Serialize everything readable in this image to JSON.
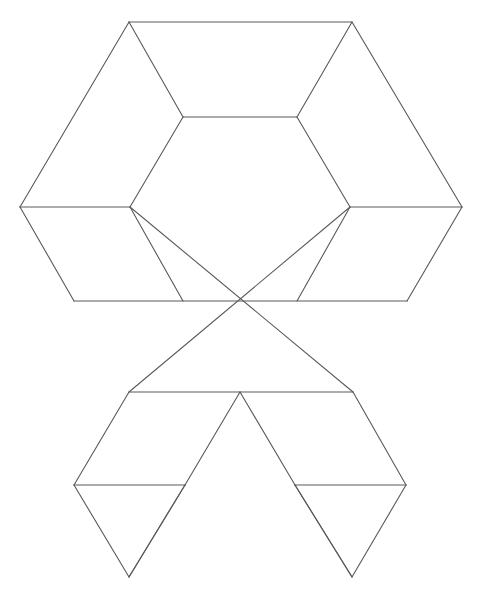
{
  "figure": {
    "width": 477,
    "height": 593,
    "background_color": "#ffffff",
    "line_color": "#5a5a5a",
    "line_width": 1.1
  },
  "chart_data": {
    "type": "diagram",
    "xlabel": "",
    "ylabel": "",
    "grid": false,
    "legend": null,
    "xlim": [
      0,
      477
    ],
    "ylim": [
      0,
      593
    ],
    "vertices": {
      "top_left": [
        129,
        22
      ],
      "top_right": [
        352,
        22
      ],
      "inner_top_left": [
        183,
        117
      ],
      "inner_top_right": [
        297,
        117
      ],
      "outer_left": [
        20,
        207
      ],
      "inner_left": [
        130,
        207
      ],
      "inner_right": [
        350,
        207
      ],
      "outer_right": [
        462,
        207
      ],
      "mid_left": [
        74,
        301
      ],
      "mid_right": [
        407,
        301
      ],
      "lower_left": [
        129,
        392
      ],
      "center_cross": [
        240,
        392
      ],
      "lower_right": [
        353,
        392
      ],
      "bottom_bar_left_start": [
        74,
        485
      ],
      "bottom_bar_left_end": [
        185,
        485
      ],
      "bottom_bar_right_start": [
        295,
        485
      ],
      "bottom_bar_right_end": [
        406,
        485
      ],
      "bottom_apex_left": [
        129,
        577
      ],
      "bottom_apex_right": [
        352,
        577
      ]
    },
    "edges": [
      {
        "name": "outer-hex-top",
        "from": [
          129,
          22
        ],
        "to": [
          352,
          22
        ]
      },
      {
        "name": "outer-hex-upper-right",
        "from": [
          352,
          22
        ],
        "to": [
          462,
          207
        ]
      },
      {
        "name": "outer-hex-lower-right",
        "from": [
          462,
          207
        ],
        "to": [
          407,
          301
        ]
      },
      {
        "name": "outer-hex-upper-left",
        "from": [
          129,
          22
        ],
        "to": [
          20,
          207
        ]
      },
      {
        "name": "outer-hex-lower-left",
        "from": [
          20,
          207
        ],
        "to": [
          74,
          301
        ]
      },
      {
        "name": "inner-hex-top",
        "from": [
          183,
          117
        ],
        "to": [
          297,
          117
        ]
      },
      {
        "name": "inner-hex-upper-left",
        "from": [
          183,
          117
        ],
        "to": [
          130,
          207
        ]
      },
      {
        "name": "inner-hex-lower-left",
        "from": [
          130,
          207
        ],
        "to": [
          183,
          301
        ]
      },
      {
        "name": "inner-hex-upper-right",
        "from": [
          297,
          117
        ],
        "to": [
          350,
          207
        ]
      },
      {
        "name": "inner-hex-lower-right",
        "from": [
          350,
          207
        ],
        "to": [
          297,
          301
        ]
      },
      {
        "name": "spoke-top-left",
        "from": [
          129,
          22
        ],
        "to": [
          183,
          117
        ]
      },
      {
        "name": "spoke-top-right",
        "from": [
          352,
          22
        ],
        "to": [
          297,
          117
        ]
      },
      {
        "name": "spoke-left",
        "from": [
          20,
          207
        ],
        "to": [
          130,
          207
        ]
      },
      {
        "name": "spoke-right",
        "from": [
          350,
          207
        ],
        "to": [
          462,
          207
        ]
      },
      {
        "name": "middle-horizontal",
        "from": [
          74,
          301
        ],
        "to": [
          407,
          301
        ]
      },
      {
        "name": "cross-left-down",
        "from": [
          130,
          207
        ],
        "to": [
          353,
          392
        ]
      },
      {
        "name": "cross-right-down",
        "from": [
          350,
          207
        ],
        "to": [
          129,
          392
        ]
      },
      {
        "name": "lower-horizontal",
        "from": [
          129,
          392
        ],
        "to": [
          353,
          392
        ]
      },
      {
        "name": "lower-left-leg",
        "from": [
          129,
          392
        ],
        "to": [
          74,
          485
        ]
      },
      {
        "name": "lower-right-leg",
        "from": [
          353,
          392
        ],
        "to": [
          406,
          485
        ]
      },
      {
        "name": "bottom-bar-left",
        "from": [
          74,
          485
        ],
        "to": [
          185,
          485
        ]
      },
      {
        "name": "bottom-bar-right",
        "from": [
          295,
          485
        ],
        "to": [
          406,
          485
        ]
      },
      {
        "name": "bottom-left-tri-left",
        "from": [
          74,
          485
        ],
        "to": [
          129,
          577
        ]
      },
      {
        "name": "bottom-left-tri-right",
        "from": [
          185,
          485
        ],
        "to": [
          129,
          577
        ]
      },
      {
        "name": "bottom-right-tri-left",
        "from": [
          295,
          485
        ],
        "to": [
          352,
          577
        ]
      },
      {
        "name": "bottom-right-tri-right",
        "from": [
          406,
          485
        ],
        "to": [
          352,
          577
        ]
      },
      {
        "name": "bottom-left-descender",
        "from": [
          240,
          392
        ],
        "to": [
          185,
          485
        ]
      },
      {
        "name": "bottom-left-descender-outer",
        "from": [
          185,
          485
        ],
        "to": [
          129,
          577
        ]
      },
      {
        "name": "bottom-right-descender",
        "from": [
          240,
          392
        ],
        "to": [
          295,
          485
        ]
      },
      {
        "name": "bottom-right-descender-outer",
        "from": [
          295,
          485
        ],
        "to": [
          352,
          577
        ]
      }
    ]
  }
}
